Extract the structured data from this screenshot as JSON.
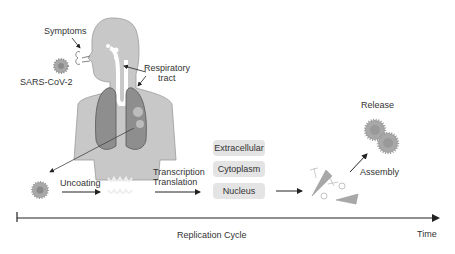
{
  "labels": {
    "symptoms": "Symptoms",
    "virus": "SARS-CoV-2",
    "respiratory_1": "Respiratory",
    "respiratory_2": "tract",
    "uncoating": "Uncoating",
    "transcription": "Transcription",
    "translation": "Translation",
    "release": "Release",
    "assembly": "Assembly",
    "timeline": "Replication Cycle",
    "time": "Time"
  },
  "compartments": [
    "Extracellular",
    "Cytoplasm",
    "Nucleus"
  ],
  "colors": {
    "body": "#c8c8c8",
    "lung": "#8e8e8e",
    "box": "#e4e4e4",
    "virus": "#9a9a9a",
    "line": "#222222"
  }
}
